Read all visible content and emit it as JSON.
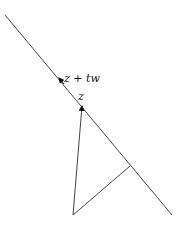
{
  "diagram": {
    "labels": {
      "z_plus_tw": "z + tw",
      "z": "z"
    },
    "colors": {
      "line": "#444444",
      "arrow": "#111111",
      "background": "#ffffff"
    }
  }
}
